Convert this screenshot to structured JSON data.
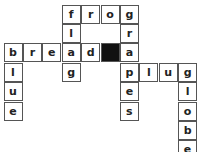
{
  "puzzle": {
    "cell_size": 19.4,
    "black_color": "#111111",
    "cells": [
      {
        "row": 0,
        "col": 3,
        "letter": "f"
      },
      {
        "row": 0,
        "col": 4,
        "letter": "r"
      },
      {
        "row": 0,
        "col": 5,
        "letter": "o"
      },
      {
        "row": 0,
        "col": 6,
        "letter": "g"
      },
      {
        "row": 1,
        "col": 3,
        "letter": "l"
      },
      {
        "row": 1,
        "col": 6,
        "letter": "r"
      },
      {
        "row": 2,
        "col": 0,
        "letter": "b"
      },
      {
        "row": 2,
        "col": 1,
        "letter": "r"
      },
      {
        "row": 2,
        "col": 2,
        "letter": "e"
      },
      {
        "row": 2,
        "col": 3,
        "letter": "a"
      },
      {
        "row": 2,
        "col": 4,
        "letter": "d"
      },
      {
        "row": 2,
        "col": 5,
        "letter": "",
        "black": true
      },
      {
        "row": 2,
        "col": 6,
        "letter": "a"
      },
      {
        "row": 3,
        "col": 0,
        "letter": "l"
      },
      {
        "row": 3,
        "col": 3,
        "letter": "g"
      },
      {
        "row": 3,
        "col": 6,
        "letter": "p"
      },
      {
        "row": 3,
        "col": 7,
        "letter": "l"
      },
      {
        "row": 3,
        "col": 8,
        "letter": "u"
      },
      {
        "row": 3,
        "col": 9,
        "letter": "g"
      },
      {
        "row": 4,
        "col": 0,
        "letter": "u"
      },
      {
        "row": 4,
        "col": 6,
        "letter": "e"
      },
      {
        "row": 4,
        "col": 9,
        "letter": "l"
      },
      {
        "row": 5,
        "col": 0,
        "letter": "e"
      },
      {
        "row": 5,
        "col": 6,
        "letter": "s"
      },
      {
        "row": 5,
        "col": 9,
        "letter": "o"
      },
      {
        "row": 6,
        "col": 9,
        "letter": "b"
      },
      {
        "row": 7,
        "col": 9,
        "letter": "e"
      }
    ],
    "words": {
      "across": [
        "frog",
        "bread",
        "plug"
      ],
      "down": [
        "flag",
        "grapes",
        "blue",
        "globe"
      ]
    }
  }
}
